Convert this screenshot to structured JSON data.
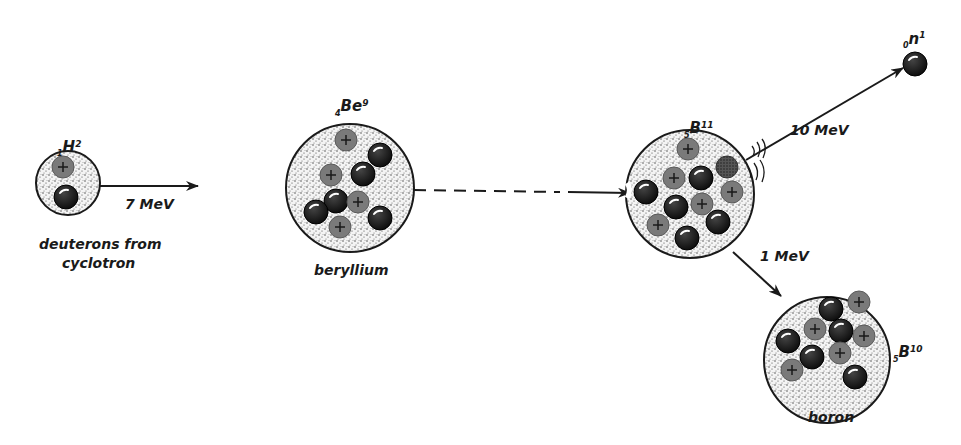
{
  "diagram": {
    "colors": {
      "proton": "#7a7a7a",
      "neutron": "#111111",
      "outline": "#1a1a1a",
      "stipple": "#333333",
      "background": "#ffffff"
    },
    "deuteron": {
      "symbol": "H",
      "z": "1",
      "a": "2",
      "caption_line1": "deuterons from",
      "caption_line2": "cyclotron",
      "energy": "7 MeV"
    },
    "beryllium": {
      "symbol": "Be",
      "z": "4",
      "a": "9",
      "caption": "beryllium"
    },
    "compound": {
      "symbol": "B",
      "z": "5",
      "a": "11"
    },
    "neutron_out": {
      "symbol": "n",
      "z": "0",
      "a": "1",
      "energy": "10 MeV"
    },
    "boron": {
      "symbol": "B",
      "z": "5",
      "a": "10",
      "caption": "boron",
      "energy": "1 MeV"
    }
  }
}
